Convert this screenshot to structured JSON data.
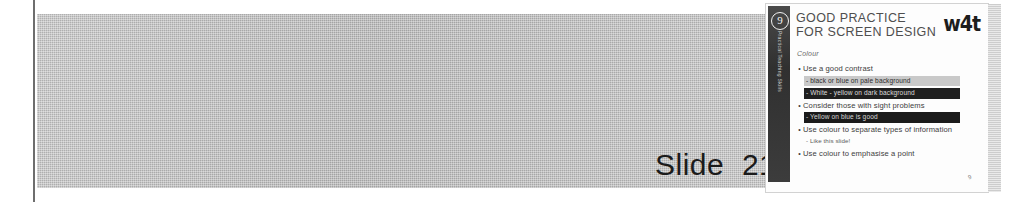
{
  "page": {
    "caption": "Slide  21"
  },
  "slide": {
    "number_badge": "9",
    "sidebar_vertical_text": "Practical Teaching Skills",
    "title": "GOOD PRACTICE\nFOR SCREEN DESIGN",
    "logo_text": "w4t",
    "subhead": "Colour",
    "corner_mark": "9",
    "bullets": [
      {
        "dot": "•",
        "text": "Use a good contrast",
        "sublines": [
          {
            "text": "- black or blue on pale background",
            "style": "pale-band"
          },
          {
            "text": "- White -  yellow on dark background",
            "style": "dark-band"
          }
        ]
      },
      {
        "dot": "•",
        "text": "Consider those with sight problems",
        "sublines": [
          {
            "text": "- Yellow on blue is good",
            "style": "dark-band-2"
          }
        ]
      },
      {
        "dot": "•",
        "text": "Use colour to separate types of information",
        "sublines": [
          {
            "text": "- Like this slide!",
            "style": "plain"
          }
        ]
      },
      {
        "dot": "•",
        "text": "Use colour to emphasise a point",
        "sublines": []
      }
    ]
  }
}
